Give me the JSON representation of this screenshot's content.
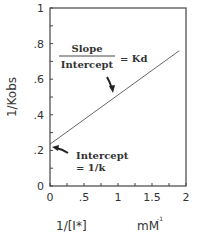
{
  "chart_data": {
    "type": "line",
    "title": "",
    "xlabel": "1/[I*]",
    "xunit": "mM",
    "xunit_superscript": "-1",
    "ylabel": "1/Kobs",
    "xlim": [
      0,
      2
    ],
    "ylim": [
      0,
      1
    ],
    "x_ticks": [
      0,
      0.5,
      1,
      1.5,
      2
    ],
    "x_tick_labels": [
      "0",
      ".5",
      "1",
      "1.5",
      "2"
    ],
    "x_minor_step": 0.25,
    "y_ticks": [
      0,
      0.2,
      0.4,
      0.6,
      0.8,
      1
    ],
    "y_tick_labels": [
      "0",
      ".2",
      ".4",
      ".6",
      ".8",
      "1"
    ],
    "y_minor_step": 0.1,
    "grid": false,
    "series": [
      {
        "name": "fit line",
        "x": [
          0,
          1.9
        ],
        "y": [
          0.235,
          0.76
        ],
        "color": "#555555"
      }
    ],
    "annotations": [
      {
        "text_numerator": "Slope",
        "text_denominator": "Intercept",
        "text_suffix": "= Kd",
        "arrow_to": [
          1.35,
          0.52
        ]
      },
      {
        "text_line1": "Intercept",
        "text_line2": "= 1/k",
        "arrow_to": [
          0.03,
          0.22
        ]
      }
    ]
  }
}
